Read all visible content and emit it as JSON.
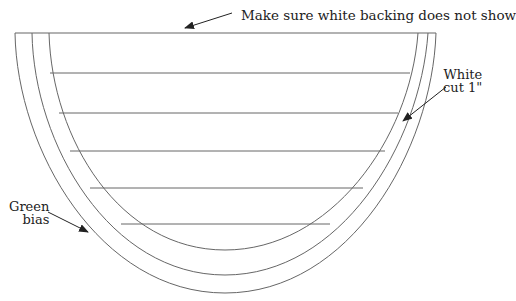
{
  "diagram": {
    "type": "sewing pattern - half-round shape with bias binding",
    "colors": {
      "stroke": "#666666",
      "text": "#222222",
      "background": "#ffffff"
    },
    "labels": {
      "top_note": "Make sure white backing does not show",
      "white_cut_line1": "White",
      "white_cut_line2": "cut 1\"",
      "green_bias_line1": "Green",
      "green_bias_line2": "bias"
    },
    "bands": [
      "outer edge",
      "green bias",
      "white cut 1\""
    ],
    "horizontal_stripe_count": 5
  }
}
